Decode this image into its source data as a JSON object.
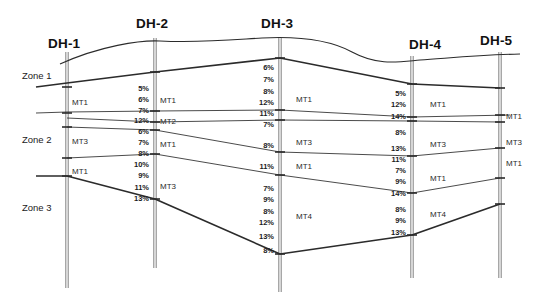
{
  "figure": {
    "type": "geological-cross-section",
    "background_color": "#ffffff",
    "line_color": "#2b2b2b",
    "borehole_color": "#8a8a8a",
    "width": 545,
    "height": 304
  },
  "zones": [
    {
      "id": "zone-1",
      "label": "Zone 1",
      "x": 22,
      "y": 71
    },
    {
      "id": "zone-2",
      "label": "Zone 2",
      "x": 22,
      "y": 135
    },
    {
      "id": "zone-3",
      "label": "Zone 3",
      "x": 22,
      "y": 203
    }
  ],
  "boreholes": [
    {
      "id": "DH-1",
      "label": "DH-1",
      "label_x": 48,
      "label_y": 37,
      "x": 67,
      "top": 52,
      "bottom": 288,
      "materials": [
        {
          "name": "MT1",
          "x": 72,
          "y": 99
        },
        {
          "name": "MT3",
          "x": 72,
          "y": 138
        },
        {
          "name": "MT1",
          "x": 72,
          "y": 168
        }
      ],
      "percentages": []
    },
    {
      "id": "DH-2",
      "label": "DH-2",
      "label_x": 136,
      "label_y": 17,
      "x": 155,
      "top": 38,
      "bottom": 268,
      "materials": [
        {
          "name": "MT1",
          "x": 160,
          "y": 97
        },
        {
          "name": "MT2",
          "x": 160,
          "y": 118
        },
        {
          "name": "MT1",
          "x": 160,
          "y": 141
        },
        {
          "name": "MT3",
          "x": 160,
          "y": 183
        }
      ],
      "percentages": [
        {
          "value": "5%",
          "y": 85
        },
        {
          "value": "6%",
          "y": 96
        },
        {
          "value": "7%",
          "y": 107
        },
        {
          "value": "12%",
          "y": 117
        },
        {
          "value": "6%",
          "y": 128
        },
        {
          "value": "7%",
          "y": 139
        },
        {
          "value": "8%",
          "y": 150
        },
        {
          "value": "10%",
          "y": 161
        },
        {
          "value": "9%",
          "y": 172
        },
        {
          "value": "11%",
          "y": 184
        },
        {
          "value": "13%",
          "y": 195
        }
      ]
    },
    {
      "id": "DH-3",
      "label": "DH-3",
      "label_x": 261,
      "label_y": 17,
      "x": 280,
      "top": 38,
      "bottom": 292,
      "materials": [
        {
          "name": "MT1",
          "x": 296,
          "y": 96
        },
        {
          "name": "MT3",
          "x": 296,
          "y": 139
        },
        {
          "name": "MT1",
          "x": 296,
          "y": 163
        },
        {
          "name": "MT4",
          "x": 296,
          "y": 213
        }
      ],
      "percentages": [
        {
          "value": "6%",
          "y": 64
        },
        {
          "value": "7%",
          "y": 76
        },
        {
          "value": "8%",
          "y": 88
        },
        {
          "value": "12%",
          "y": 99
        },
        {
          "value": "11%",
          "y": 110
        },
        {
          "value": "7%",
          "y": 121
        },
        {
          "value": "8%",
          "y": 142
        },
        {
          "value": "11%",
          "y": 163
        },
        {
          "value": "7%",
          "y": 185
        },
        {
          "value": "9%",
          "y": 196
        },
        {
          "value": "8%",
          "y": 208
        },
        {
          "value": "12%",
          "y": 219
        },
        {
          "value": "13%",
          "y": 233
        },
        {
          "value": "8%",
          "y": 247
        }
      ]
    },
    {
      "id": "DH-4",
      "label": "DH-4",
      "label_x": 409,
      "label_y": 38,
      "x": 412,
      "top": 56,
      "bottom": 278,
      "materials": [
        {
          "name": "MT1",
          "x": 430,
          "y": 101
        },
        {
          "name": "MT3",
          "x": 430,
          "y": 141
        },
        {
          "name": "MT1",
          "x": 430,
          "y": 175
        },
        {
          "name": "MT4",
          "x": 430,
          "y": 211
        }
      ],
      "percentages": [
        {
          "value": "5%",
          "y": 90
        },
        {
          "value": "12%",
          "y": 101
        },
        {
          "value": "14%",
          "y": 113
        },
        {
          "value": "8%",
          "y": 129
        },
        {
          "value": "13%",
          "y": 145
        },
        {
          "value": "11%",
          "y": 156
        },
        {
          "value": "7%",
          "y": 167
        },
        {
          "value": "9%",
          "y": 178
        },
        {
          "value": "14%",
          "y": 190
        },
        {
          "value": "8%",
          "y": 206
        },
        {
          "value": "9%",
          "y": 217
        },
        {
          "value": "13%",
          "y": 229
        }
      ]
    },
    {
      "id": "DH-5",
      "label": "DH-5",
      "label_x": 480,
      "label_y": 34,
      "x": 500,
      "top": 52,
      "bottom": 278,
      "materials": [
        {
          "name": "MT1",
          "x": 506,
          "y": 113
        },
        {
          "name": "MT3",
          "x": 506,
          "y": 139
        },
        {
          "name": "MT1",
          "x": 506,
          "y": 160
        }
      ],
      "percentages": []
    }
  ],
  "contacts": {
    "ground_surface": "M 60,64 C 100,46 140,40 160,41 C 200,43 230,40 262,38 C 300,36 330,40 352,52 C 378,66 398,62 420,60 C 450,58 478,55 520,54",
    "layer_boundaries": [
      {
        "name": "top-of-MT1",
        "path": "M 36,87 L 67,83 L 155,72 L 280,58 L 412,84 L 500,88"
      },
      {
        "name": "MT1-base",
        "path": "M 36,113 L 67,112 L 155,111 L 280,110 L 412,117 L 510,115"
      },
      {
        "name": "MT2-base",
        "path": "M 67,118 L 155,122 L 280,120 L 412,121 L 500,122"
      },
      {
        "name": "MT3-base",
        "path": "M 67,127 L 155,130 L 280,152 L 412,156 L 500,148"
      },
      {
        "name": "MT1-lower-base",
        "path": "M 67,158 L 155,154 L 280,175 L 412,193 L 500,178"
      },
      {
        "name": "bedrock-top",
        "path": "M 36,176 L 67,176 L 155,199 L 280,254 L 412,235 L 500,204"
      }
    ]
  },
  "tick_marks": {
    "dh1": [
      87,
      113,
      127,
      158,
      176
    ],
    "dh2": [
      72,
      111,
      122,
      130,
      154,
      199
    ],
    "dh3": [
      58,
      110,
      120,
      152,
      175,
      254
    ],
    "dh4": [
      84,
      117,
      121,
      156,
      193,
      235
    ],
    "dh5": [
      88,
      115,
      122,
      148,
      178,
      204
    ]
  }
}
